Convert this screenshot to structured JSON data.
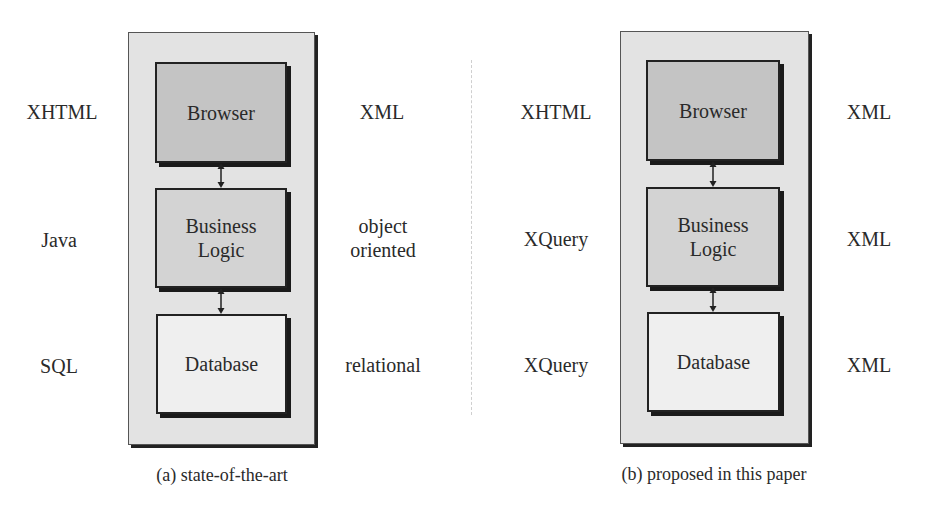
{
  "diagrams": [
    {
      "id": "a",
      "caption": "(a) state-of-the-art",
      "tiers": [
        {
          "name": "Browser",
          "left_label": "XHTML",
          "right_label": "XML"
        },
        {
          "name": "Business Logic",
          "left_label": "Java",
          "right_label": "object oriented"
        },
        {
          "name": "Database",
          "left_label": "SQL",
          "right_label": "relational"
        }
      ]
    },
    {
      "id": "b",
      "caption": "(b) proposed in this paper",
      "tiers": [
        {
          "name": "Browser",
          "left_label": "XHTML",
          "right_label": "XML"
        },
        {
          "name": "Business Logic",
          "left_label": "XQuery",
          "right_label": "XML"
        },
        {
          "name": "Database",
          "left_label": "XQuery",
          "right_label": "XML"
        }
      ]
    }
  ],
  "colors": {
    "browser_fill": "#c4c4c4",
    "logic_fill": "#d3d3d3",
    "database_fill": "#efefef",
    "panel_fill": "#e3e3e3",
    "border": "#222222"
  },
  "connectors": [
    {
      "from": "Browser",
      "to": "Business Logic",
      "type": "bidirectional-arrow"
    },
    {
      "from": "Business Logic",
      "to": "Database",
      "type": "bidirectional-arrow"
    }
  ]
}
